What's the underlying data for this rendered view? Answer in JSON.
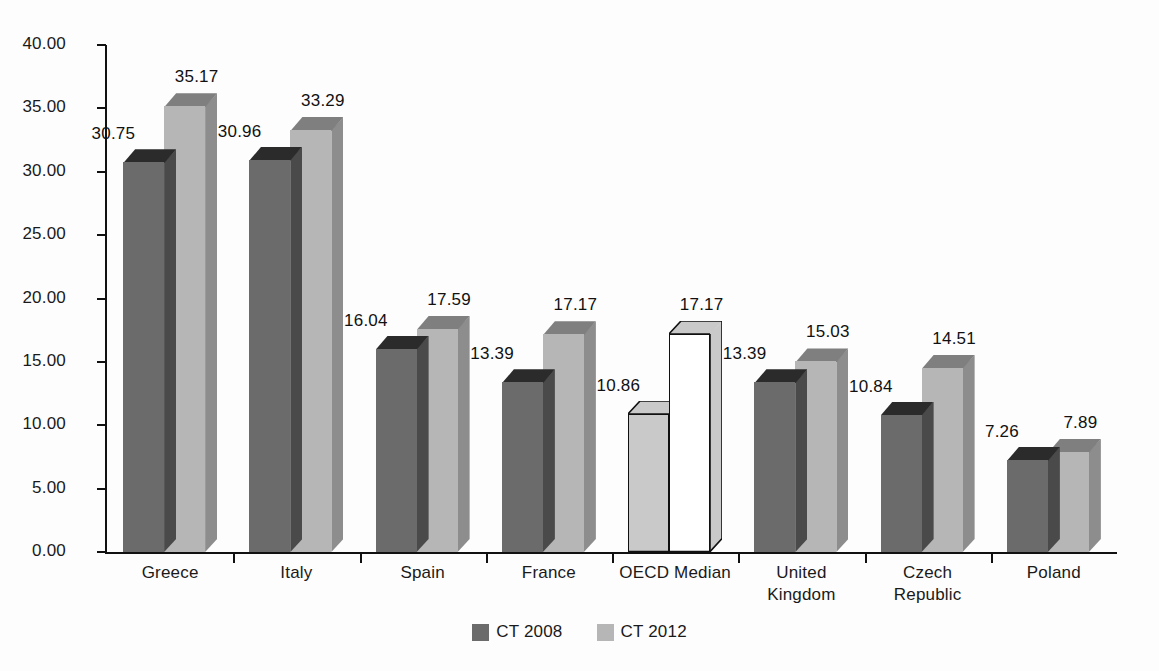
{
  "chart_data": {
    "type": "bar",
    "title": "",
    "subtitle": "",
    "xlabel": "",
    "ylabel": "",
    "ylim": [
      0,
      40
    ],
    "ytick_step": 5,
    "grid": false,
    "legend_position": "bottom-center",
    "style": "3d-clustered-column",
    "categories": [
      "Greece",
      "Italy",
      "Spain",
      "France",
      "OECD Median",
      "United\nKingdom",
      "Czech\nRepublic",
      "Poland"
    ],
    "ytick_labels": [
      "40.00",
      "35.00",
      "30.00",
      "25.00",
      "20.00",
      "15.00",
      "10.00",
      "5.00",
      "0.00"
    ],
    "ytick_values": [
      40,
      35,
      30,
      25,
      20,
      15,
      10,
      5,
      0
    ],
    "series": [
      {
        "name": "CT 2008",
        "color": "#6b6b6b",
        "top_color": "#2b2b2b",
        "side_color": "#4a4a4a",
        "values": [
          30.75,
          30.96,
          16.04,
          13.39,
          10.86,
          13.39,
          10.84,
          7.26
        ],
        "value_labels": [
          "30.75",
          "30.96",
          "16.04",
          "13.39",
          "10.86",
          "13.39",
          "10.84",
          "7.26"
        ]
      },
      {
        "name": "CT 2012",
        "color": "#b6b6b6",
        "top_color": "#7f7f7f",
        "side_color": "#8d8d8d",
        "values": [
          35.17,
          33.29,
          17.59,
          17.17,
          17.17,
          15.03,
          14.51,
          7.89
        ],
        "value_labels": [
          "35.17",
          "33.29",
          "17.59",
          "17.17",
          "17.17",
          "15.03",
          "14.51",
          "7.89"
        ]
      }
    ],
    "highlighted_category": "OECD Median",
    "highlight_note": "OECD Median columns are drawn outlined: CT 2008 light grey fill, CT 2012 white fill"
  },
  "legend": {
    "items": [
      {
        "label": "CT 2008",
        "color": "#6b6b6b"
      },
      {
        "label": "CT 2012",
        "color": "#b6b6b6"
      }
    ]
  }
}
